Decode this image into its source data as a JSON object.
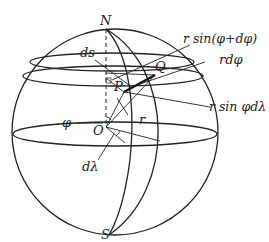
{
  "figure": {
    "stroke_color": "#222222",
    "background": "#ffffff"
  },
  "labels": {
    "north": "N",
    "south": "S",
    "ds": "ds",
    "p": "P",
    "q": "Q",
    "o": "O",
    "phi": "φ",
    "r": "r",
    "d_lambda": "dλ",
    "r_sin_phi_dphi": "r sin(φ+dφ)",
    "r_dphi": "rdφ",
    "r_sin_phi_dlambda": "r sin φdλ"
  }
}
